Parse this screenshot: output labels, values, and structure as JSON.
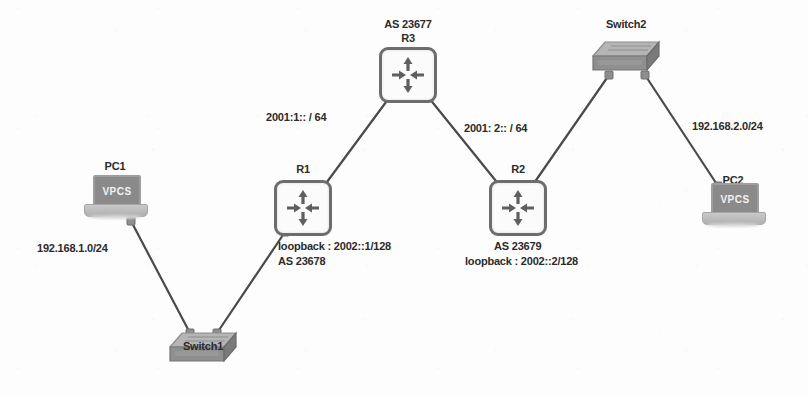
{
  "diagram": {
    "background_color": "#fdfdfd",
    "line_color": "#4a4a4a",
    "device_color": "#6d6d6d",
    "text_color": "#2b2b2b"
  },
  "nodes": {
    "r3": {
      "name": "R3",
      "type": "router",
      "as_label": "AS 23677",
      "name_label": "R3",
      "x": 408,
      "y": 75
    },
    "r1": {
      "name": "R1",
      "type": "router",
      "name_label": "R1",
      "loopback_label": "loopback : 2002::1/128",
      "as_label": "AS 23678",
      "x": 303,
      "y": 208
    },
    "r2": {
      "name": "R2",
      "type": "router",
      "name_label": "R2",
      "as_label": "AS 23679",
      "loopback_label": "loopback : 2002::2/128",
      "x": 518,
      "y": 208
    },
    "switch1": {
      "name": "Switch1",
      "type": "switch",
      "name_label": "Switch1",
      "x": 203,
      "y": 348
    },
    "switch2": {
      "name": "Switch2",
      "type": "switch",
      "name_label": "Switch2",
      "x": 626,
      "y": 57
    },
    "pc1": {
      "name": "PC1",
      "type": "laptop",
      "name_label": "PC1",
      "screen_text": "VPCS",
      "x": 115,
      "y": 197
    },
    "pc2": {
      "name": "PC2",
      "type": "laptop",
      "name_label": "PC2",
      "screen_text": "VPCS",
      "x": 733,
      "y": 205
    }
  },
  "link_labels": {
    "r1_r3": "2001:1:: / 64",
    "r3_r2": "2001: 2:: / 64",
    "pc1_switch1": "192.168.1.0/24",
    "switch2_pc2": "192.168.2.0/24"
  },
  "links": [
    {
      "name": "pc1-to-switch1",
      "from": "pc1",
      "to": "switch1"
    },
    {
      "name": "switch1-to-r1",
      "from": "switch1",
      "to": "r1"
    },
    {
      "name": "r1-to-r3",
      "from": "r1",
      "to": "r3"
    },
    {
      "name": "r3-to-r2",
      "from": "r3",
      "to": "r2"
    },
    {
      "name": "r2-to-switch2",
      "from": "r2",
      "to": "switch2"
    },
    {
      "name": "switch2-to-pc2",
      "from": "switch2",
      "to": "pc2"
    }
  ]
}
